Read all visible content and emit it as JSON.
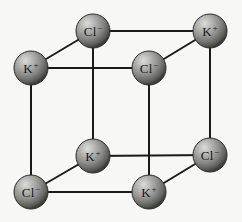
{
  "figure": {
    "name": "potassium-chloride-crystal-lattice",
    "background_color": "#f7f7f4",
    "edge_color": "#1a1a1a",
    "edge_width": 2,
    "sphere_radius": 17,
    "sphere_colors": {
      "highlight": "#d8d8d4",
      "midtone": "#8e8e8a",
      "shadow": "#4a4a47",
      "rim": "#2b2b29"
    },
    "width": 242,
    "height": 222
  },
  "ions": [
    {
      "id": "back-top-left",
      "label": "Cl",
      "charge": "−",
      "cx": 93,
      "cy": 31,
      "r": 17
    },
    {
      "id": "back-top-right",
      "label": "K",
      "charge": "+",
      "cx": 210,
      "cy": 31,
      "r": 17
    },
    {
      "id": "front-top-left",
      "label": "K",
      "charge": "+",
      "cx": 31,
      "cy": 68,
      "r": 17
    },
    {
      "id": "front-top-right",
      "label": "Cl",
      "charge": "−",
      "cx": 149,
      "cy": 68,
      "r": 17
    },
    {
      "id": "back-bottom-left",
      "label": "K",
      "charge": "+",
      "cx": 93,
      "cy": 156,
      "r": 17
    },
    {
      "id": "back-bottom-right",
      "label": "Cl",
      "charge": "−",
      "cx": 210,
      "cy": 155,
      "r": 17
    },
    {
      "id": "front-bottom-left",
      "label": "Cl",
      "charge": "−",
      "cx": 31,
      "cy": 192,
      "r": 17
    },
    {
      "id": "front-bottom-right",
      "label": "K",
      "charge": "+",
      "cx": 149,
      "cy": 192,
      "r": 17
    }
  ],
  "bonds": [
    {
      "id": "back-top-edge",
      "x1": 93,
      "y1": 31,
      "x2": 210,
      "y2": 31
    },
    {
      "id": "front-top-edge",
      "x1": 31,
      "y1": 68,
      "x2": 149,
      "y2": 68
    },
    {
      "id": "back-bottom-edge",
      "x1": 93,
      "y1": 156,
      "x2": 210,
      "y2": 155
    },
    {
      "id": "front-bottom-edge",
      "x1": 31,
      "y1": 192,
      "x2": 149,
      "y2": 192
    },
    {
      "id": "front-left-vertical",
      "x1": 31,
      "y1": 68,
      "x2": 31,
      "y2": 192
    },
    {
      "id": "front-right-vertical",
      "x1": 149,
      "y1": 68,
      "x2": 149,
      "y2": 192
    },
    {
      "id": "back-left-vertical",
      "x1": 93,
      "y1": 31,
      "x2": 93,
      "y2": 156
    },
    {
      "id": "back-right-vertical",
      "x1": 210,
      "y1": 31,
      "x2": 210,
      "y2": 155
    },
    {
      "id": "depth-top-left",
      "x1": 31,
      "y1": 68,
      "x2": 93,
      "y2": 31
    },
    {
      "id": "depth-top-right",
      "x1": 149,
      "y1": 68,
      "x2": 210,
      "y2": 31
    },
    {
      "id": "depth-bottom-left",
      "x1": 31,
      "y1": 192,
      "x2": 93,
      "y2": 156
    },
    {
      "id": "depth-bottom-right",
      "x1": 149,
      "y1": 192,
      "x2": 210,
      "y2": 155
    }
  ]
}
